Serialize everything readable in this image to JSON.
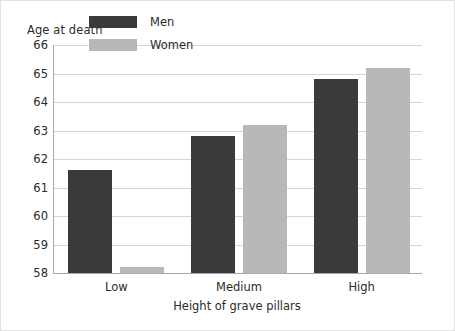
{
  "chart_data": {
    "type": "bar",
    "title": "",
    "ylabel": "Age at death",
    "xlabel": "Height of grave pillars",
    "categories": [
      "Low",
      "Medium",
      "High"
    ],
    "series": [
      {
        "name": "Men",
        "color": "#3a3a3a",
        "values": [
          61.6,
          62.8,
          64.8
        ]
      },
      {
        "name": "Women",
        "color": "#b8b8b8",
        "values": [
          58.2,
          63.2,
          65.2
        ]
      }
    ],
    "ylim": [
      58,
      66
    ],
    "yticks": [
      66,
      65,
      64,
      63,
      62,
      61,
      60,
      59,
      58
    ],
    "ytick_labels": [
      "66",
      "65",
      "64",
      "63",
      "62",
      "61",
      "60",
      "59",
      "58"
    ],
    "grid": true,
    "legend_position": "top-left-inside"
  }
}
